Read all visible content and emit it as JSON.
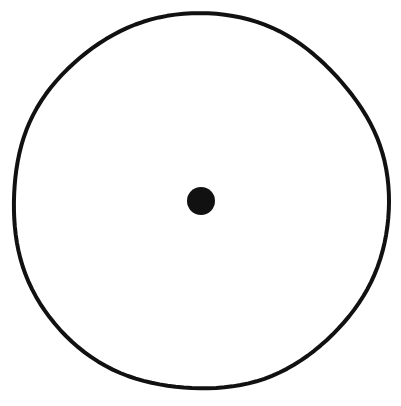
{
  "figure": {
    "type": "line-drawing",
    "canvas": {
      "width": 401,
      "height": 406,
      "background_color": "#ffffff"
    },
    "ink_color": "#111111",
    "shapes": {
      "outer_circle": {
        "name": "outer-circle",
        "kind": "circle-outline",
        "center_x": 200,
        "center_y": 202,
        "radius_x": 188,
        "radius_y": 188,
        "stroke_width": 4,
        "stroke_color": "#111111",
        "fill": "none",
        "style": "hand-drawn, slightly irregular scanned line"
      },
      "center_dot": {
        "name": "center-dot",
        "kind": "filled-circle",
        "center_x": 201,
        "center_y": 201,
        "radius": 14,
        "diameter": 28,
        "fill_color": "#111111",
        "stroke": "none"
      }
    }
  }
}
